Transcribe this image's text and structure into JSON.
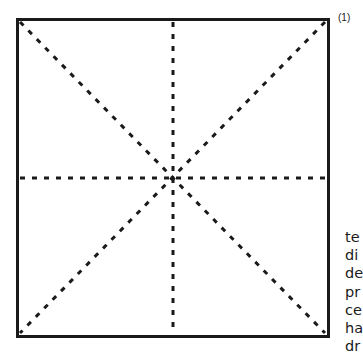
{
  "figure": {
    "step_label": "(1)",
    "square": {
      "x": 17,
      "y": 19,
      "width": 311,
      "height": 317
    },
    "center": {
      "x": 175,
      "y": 178
    },
    "line_color": "#1a1a1a"
  },
  "side_text": {
    "lines": [
      "te",
      "di",
      "de",
      "pr",
      "ce",
      "ha",
      "dr"
    ]
  }
}
